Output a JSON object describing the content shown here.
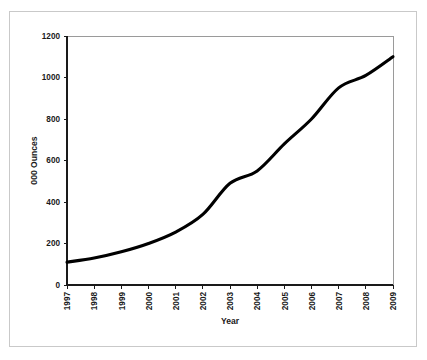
{
  "figure": {
    "border_color": "#c9c9c9",
    "background": "#ffffff"
  },
  "chart_data": {
    "type": "line",
    "title": "",
    "subtitle": "",
    "xlabel": "Year",
    "ylabel": "000 Ounces",
    "categories": [
      "1997",
      "1998",
      "1999",
      "2000",
      "2001",
      "2002",
      "2003",
      "2004",
      "2005",
      "2006",
      "2007",
      "2008",
      "2009"
    ],
    "values": [
      110,
      130,
      160,
      200,
      255,
      340,
      490,
      550,
      680,
      800,
      950,
      1010,
      1100
    ],
    "series": [
      {
        "name": "Production",
        "color": "#000000",
        "values": [
          110,
          130,
          160,
          200,
          255,
          340,
          490,
          550,
          680,
          800,
          950,
          1010,
          1100
        ]
      }
    ],
    "ylim": [
      0,
      1200
    ],
    "ytick_values": [
      0,
      200,
      400,
      600,
      800,
      1000,
      1200
    ],
    "ytick_labels": [
      "0",
      "200",
      "400",
      "600",
      "800",
      "1000",
      "1200"
    ],
    "xtick_labels": [
      "1997",
      "1998",
      "1999",
      "2000",
      "2001",
      "2002",
      "2003",
      "2004",
      "2005",
      "2006",
      "2007",
      "2008",
      "2009"
    ],
    "xtick_rotation_degrees": 90,
    "grid": false,
    "legend": null,
    "legend_position": "none",
    "annotations": [],
    "line_color": "#000000",
    "axis_color": "#1a1a1a",
    "plot_background": "#ffffff"
  },
  "plot_geometry": {
    "left": 67,
    "right": 393,
    "top": 36,
    "bottom": 285
  }
}
